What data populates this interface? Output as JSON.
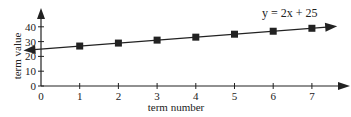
{
  "chart_data": {
    "type": "line",
    "title": "",
    "annotation": "y = 2x + 25",
    "xlabel": "term number",
    "ylabel": "term value",
    "x_ticks": [
      "0",
      "1",
      "2",
      "3",
      "4",
      "5",
      "6",
      "7"
    ],
    "y_ticks": [
      "0",
      "10",
      "20",
      "30",
      "40"
    ],
    "xlim": [
      0,
      7.5
    ],
    "ylim": [
      0,
      48
    ],
    "grid": false,
    "legend": null,
    "series": [
      {
        "name": "y = 2x + 25",
        "marker": "square",
        "x": [
          1,
          2,
          3,
          4,
          5,
          6,
          7
        ],
        "values": [
          27,
          29,
          31,
          33,
          35,
          37,
          39
        ]
      }
    ],
    "line": {
      "slope": 2,
      "intercept": 25,
      "extends_both_directions": true
    }
  },
  "colors": {
    "ink": "#222222",
    "background": "#ffffff"
  }
}
